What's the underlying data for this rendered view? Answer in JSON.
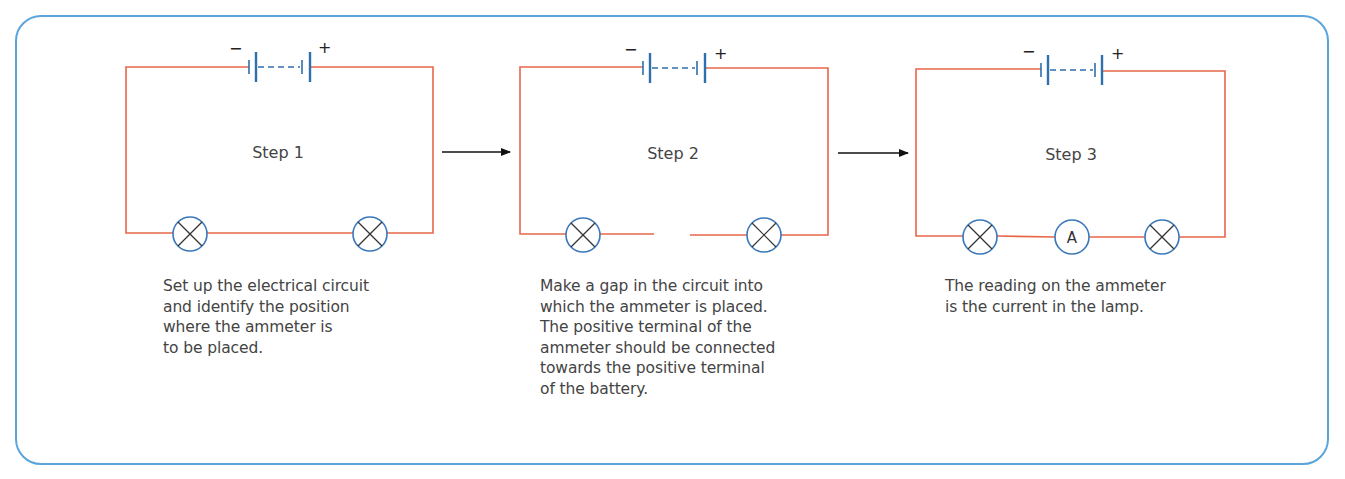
{
  "figure": {
    "frame_color": "#5ba4dc",
    "wire_color": "#e8674a",
    "component_color": "#2e6fad",
    "steps": [
      {
        "label": "Step 1",
        "battery": {
          "negative_sign": "−",
          "positive_sign": "+"
        },
        "components": [
          "lamp",
          "lamp"
        ],
        "caption": "Set up the electrical circuit\nand identify the position\nwhere the ammeter is\nto be placed."
      },
      {
        "label": "Step 2",
        "battery": {
          "negative_sign": "−",
          "positive_sign": "+"
        },
        "components": [
          "lamp",
          "gap",
          "lamp"
        ],
        "caption": "Make a gap in the circuit into\nwhich the ammeter is placed.\nThe positive terminal of the\nammeter should be connected\ntowards the positive terminal\nof the battery."
      },
      {
        "label": "Step 3",
        "battery": {
          "negative_sign": "−",
          "positive_sign": "+"
        },
        "components": [
          "lamp",
          "ammeter",
          "lamp"
        ],
        "ammeter_symbol": "A",
        "caption": "The reading on the ammeter\nis the current in the lamp."
      }
    ],
    "arrows": [
      "step1-to-step2",
      "step2-to-step3"
    ]
  }
}
